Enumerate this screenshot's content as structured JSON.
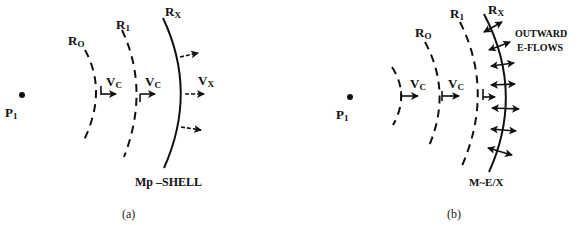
{
  "panels": [
    {
      "caption": "(a)",
      "point_label": {
        "main": "P",
        "sub": "1"
      },
      "labels": {
        "r0": {
          "main": "R",
          "sub": "O"
        },
        "r1": {
          "main": "R",
          "sub": "1"
        },
        "rx": {
          "main": "R",
          "sub": "X"
        },
        "vc1": {
          "main": "V",
          "sub": "C"
        },
        "vc2": {
          "main": "V",
          "sub": "C"
        },
        "vx": {
          "main": "V",
          "sub": "X"
        }
      },
      "shell_label": "Mp –SHELL"
    },
    {
      "caption": "(b)",
      "point_label": {
        "main": "P",
        "sub": "1"
      },
      "labels": {
        "r0": {
          "main": "R",
          "sub": "O"
        },
        "r1": {
          "main": "R",
          "sub": "1"
        },
        "rx": {
          "main": "R",
          "sub": "X"
        },
        "vc1": {
          "main": "V",
          "sub": "C"
        },
        "vc2": {
          "main": "V",
          "sub": "C"
        }
      },
      "flow_label_line1": "OUTWARD",
      "flow_label_line2": "E-FLOWS",
      "shell_label": "M~E/X"
    }
  ]
}
